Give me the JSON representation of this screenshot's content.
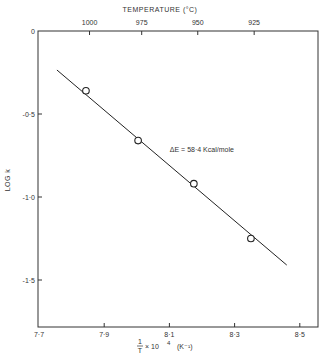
{
  "chart_data": {
    "type": "scatter",
    "title": "",
    "top_axis_title": "TEMPERATURE (°C)",
    "top_ticks": [
      {
        "label": "1000",
        "x": 7.855
      },
      {
        "label": "975",
        "x": 8.015
      },
      {
        "label": "950",
        "x": 8.187
      },
      {
        "label": "925",
        "x": 8.36
      }
    ],
    "xlabel_parts": {
      "fraction_num": "1",
      "fraction_den": "T",
      "times": "× 10",
      "exp": "4",
      "unit": "(K⁻¹)"
    },
    "ylabel": "LOG k",
    "xlim": [
      7.7,
      8.55
    ],
    "ylim": [
      -1.78,
      0
    ],
    "x_ticks": [
      {
        "value": 7.7,
        "label": "7·7"
      },
      {
        "value": 7.9,
        "label": "7·9"
      },
      {
        "value": 8.1,
        "label": "8·1"
      },
      {
        "value": 8.3,
        "label": "8·3"
      },
      {
        "value": 8.5,
        "label": "8·5"
      }
    ],
    "y_ticks": [
      {
        "value": 0,
        "label": "0"
      },
      {
        "value": -0.5,
        "label": "-0·5"
      },
      {
        "value": -1.0,
        "label": "-1·0"
      },
      {
        "value": -1.5,
        "label": "-1·5"
      }
    ],
    "points": [
      {
        "x": 7.844,
        "y": -0.36
      },
      {
        "x": 8.004,
        "y": -0.66
      },
      {
        "x": 8.175,
        "y": -0.92
      },
      {
        "x": 8.35,
        "y": -1.25
      }
    ],
    "fit_line": [
      {
        "x": 7.755,
        "y": -0.235
      },
      {
        "x": 8.46,
        "y": -1.41
      }
    ],
    "annotation": {
      "text": "ΔE = 58·4 Kcal/mole",
      "x": 8.04,
      "y": -0.69
    },
    "grid": false,
    "legend": "none"
  }
}
